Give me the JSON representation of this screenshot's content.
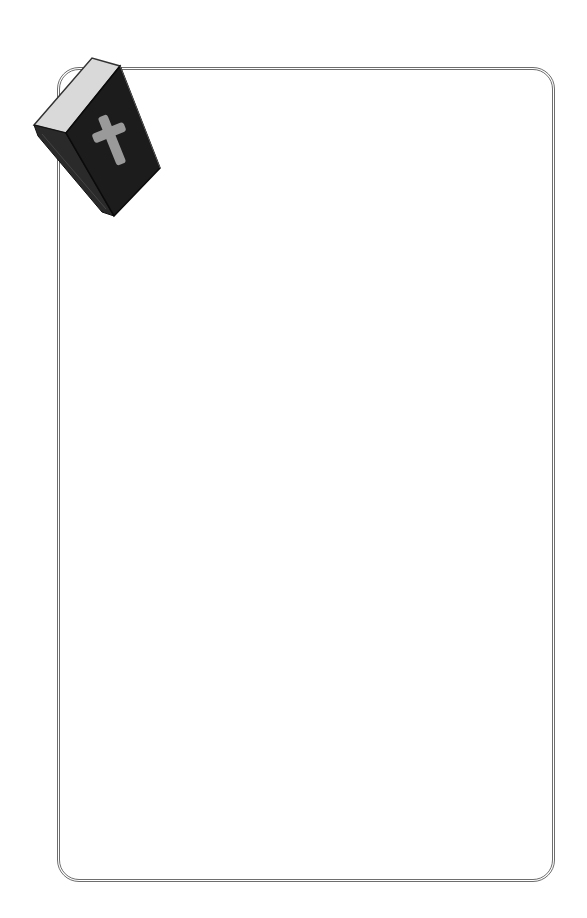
{
  "page": {
    "type": "blank-bordered-stationery",
    "background_color": "#ffffff",
    "border_color": "#6e6e6e"
  },
  "decoration": {
    "icon": "bible-book-with-cross-icon",
    "book_cover_color": "#1c1c1c",
    "page_edge_color": "#d9d9d9",
    "cross_color": "#9a9a9a"
  },
  "content": {
    "text": ""
  }
}
